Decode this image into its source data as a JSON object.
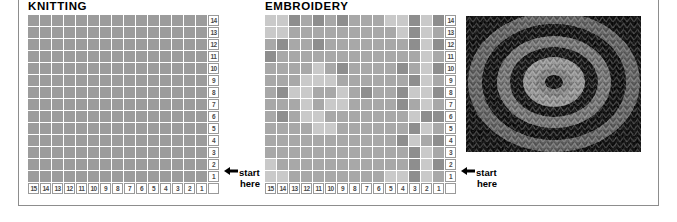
{
  "page": {
    "frame_color": "#8d8d8d",
    "background": "#ffffff"
  },
  "panels": [
    {
      "id": "knitting",
      "title": "KNITTING",
      "columns": 15,
      "rows": 14,
      "row_labels": [
        "14",
        "13",
        "12",
        "11",
        "10",
        "9",
        "8",
        "7",
        "6",
        "5",
        "4",
        "3",
        "2",
        "1"
      ],
      "column_labels": [
        "15",
        "14",
        "13",
        "12",
        "11",
        "10",
        "9",
        "8",
        "7",
        "6",
        "5",
        "4",
        "3",
        "2",
        "1"
      ],
      "start_note": {
        "line1": "start",
        "line2": "here",
        "arrow": "←"
      }
    },
    {
      "id": "embroidery",
      "title": "EMBROIDERY",
      "columns": 15,
      "rows": 14,
      "row_labels": [
        "14",
        "13",
        "12",
        "11",
        "10",
        "9",
        "8",
        "7",
        "6",
        "5",
        "4",
        "3",
        "2",
        "1"
      ],
      "column_labels": [
        "15",
        "14",
        "13",
        "12",
        "11",
        "10",
        "9",
        "8",
        "7",
        "6",
        "5",
        "4",
        "3",
        "2",
        "1"
      ],
      "start_note": {
        "line1": "start",
        "line2": "here",
        "arrow": "←"
      }
    }
  ],
  "chart_data": [
    {
      "type": "heatmap",
      "title": "KNITTING",
      "xlabel": "",
      "ylabel": "",
      "legend": "none",
      "grid": true,
      "x": [
        "15",
        "14",
        "13",
        "12",
        "11",
        "10",
        "9",
        "8",
        "7",
        "6",
        "5",
        "4",
        "3",
        "2",
        "1"
      ],
      "y": [
        "14",
        "13",
        "12",
        "11",
        "10",
        "9",
        "8",
        "7",
        "6",
        "5",
        "4",
        "3",
        "2",
        "1"
      ],
      "palette": {
        "gray": "#9c9c9c"
      },
      "values": [
        [
          "gray",
          "gray",
          "gray",
          "gray",
          "gray",
          "gray",
          "gray",
          "gray",
          "gray",
          "gray",
          "gray",
          "gray",
          "gray",
          "gray",
          "gray"
        ],
        [
          "gray",
          "gray",
          "gray",
          "gray",
          "gray",
          "gray",
          "gray",
          "gray",
          "gray",
          "gray",
          "gray",
          "gray",
          "gray",
          "gray",
          "gray"
        ],
        [
          "gray",
          "gray",
          "gray",
          "gray",
          "gray",
          "gray",
          "gray",
          "gray",
          "gray",
          "gray",
          "gray",
          "gray",
          "gray",
          "gray",
          "gray"
        ],
        [
          "gray",
          "gray",
          "gray",
          "gray",
          "gray",
          "gray",
          "gray",
          "gray",
          "gray",
          "gray",
          "gray",
          "gray",
          "gray",
          "gray",
          "gray"
        ],
        [
          "gray",
          "gray",
          "gray",
          "gray",
          "gray",
          "gray",
          "gray",
          "gray",
          "gray",
          "gray",
          "gray",
          "gray",
          "gray",
          "gray",
          "gray"
        ],
        [
          "gray",
          "gray",
          "gray",
          "gray",
          "gray",
          "gray",
          "gray",
          "gray",
          "gray",
          "gray",
          "gray",
          "gray",
          "gray",
          "gray",
          "gray"
        ],
        [
          "gray",
          "gray",
          "gray",
          "gray",
          "gray",
          "gray",
          "gray",
          "gray",
          "gray",
          "gray",
          "gray",
          "gray",
          "gray",
          "gray",
          "gray"
        ],
        [
          "gray",
          "gray",
          "gray",
          "gray",
          "gray",
          "gray",
          "gray",
          "gray",
          "gray",
          "gray",
          "gray",
          "gray",
          "gray",
          "gray",
          "gray"
        ],
        [
          "gray",
          "gray",
          "gray",
          "gray",
          "gray",
          "gray",
          "gray",
          "gray",
          "gray",
          "gray",
          "gray",
          "gray",
          "gray",
          "gray",
          "gray"
        ],
        [
          "gray",
          "gray",
          "gray",
          "gray",
          "gray",
          "gray",
          "gray",
          "gray",
          "gray",
          "gray",
          "gray",
          "gray",
          "gray",
          "gray",
          "gray"
        ],
        [
          "gray",
          "gray",
          "gray",
          "gray",
          "gray",
          "gray",
          "gray",
          "gray",
          "gray",
          "gray",
          "gray",
          "gray",
          "gray",
          "gray",
          "gray"
        ],
        [
          "gray",
          "gray",
          "gray",
          "gray",
          "gray",
          "gray",
          "gray",
          "gray",
          "gray",
          "gray",
          "gray",
          "gray",
          "gray",
          "gray",
          "gray"
        ],
        [
          "gray",
          "gray",
          "gray",
          "gray",
          "gray",
          "gray",
          "gray",
          "gray",
          "gray",
          "gray",
          "gray",
          "gray",
          "gray",
          "gray",
          "gray"
        ],
        [
          "gray",
          "gray",
          "gray",
          "gray",
          "gray",
          "gray",
          "gray",
          "gray",
          "gray",
          "gray",
          "gray",
          "gray",
          "gray",
          "gray",
          "gray"
        ]
      ]
    },
    {
      "type": "heatmap",
      "title": "EMBROIDERY",
      "xlabel": "",
      "ylabel": "",
      "legend": "none",
      "grid": true,
      "x": [
        "15",
        "14",
        "13",
        "12",
        "11",
        "10",
        "9",
        "8",
        "7",
        "6",
        "5",
        "4",
        "3",
        "2",
        "1"
      ],
      "y": [
        "14",
        "13",
        "12",
        "11",
        "10",
        "9",
        "8",
        "7",
        "6",
        "5",
        "4",
        "3",
        "2",
        "1"
      ],
      "palette": {
        "light": "#c9c9c9",
        "mid": "#a8a8a8",
        "dark": "#8e8e8e"
      },
      "values": [
        [
          "light",
          "light",
          "dark",
          "mid",
          "dark",
          "mid",
          "dark",
          "mid",
          "mid",
          "mid",
          "light",
          "light",
          "dark",
          "light",
          "dark"
        ],
        [
          "light",
          "light",
          "mid",
          "mid",
          "mid",
          "mid",
          "mid",
          "mid",
          "mid",
          "mid",
          "mid",
          "light",
          "dark",
          "light",
          "mid"
        ],
        [
          "mid",
          "dark",
          "mid",
          "mid",
          "dark",
          "mid",
          "mid",
          "mid",
          "mid",
          "mid",
          "mid",
          "mid",
          "dark",
          "light",
          "dark"
        ],
        [
          "dark",
          "mid",
          "mid",
          "mid",
          "mid",
          "mid",
          "mid",
          "mid",
          "mid",
          "mid",
          "mid",
          "mid",
          "mid",
          "light",
          "mid"
        ],
        [
          "mid",
          "mid",
          "mid",
          "mid",
          "light",
          "mid",
          "dark",
          "mid",
          "mid",
          "mid",
          "mid",
          "dark",
          "mid",
          "light",
          "dark"
        ],
        [
          "mid",
          "mid",
          "mid",
          "light",
          "light",
          "light",
          "mid",
          "mid",
          "mid",
          "mid",
          "mid",
          "mid",
          "dark",
          "light",
          "mid"
        ],
        [
          "mid",
          "dark",
          "light",
          "light",
          "mid",
          "mid",
          "light",
          "mid",
          "dark",
          "mid",
          "mid",
          "dark",
          "light",
          "light",
          "dark"
        ],
        [
          "mid",
          "mid",
          "mid",
          "light",
          "mid",
          "light",
          "light",
          "mid",
          "mid",
          "mid",
          "mid",
          "dark",
          "mid",
          "light",
          "mid"
        ],
        [
          "mid",
          "dark",
          "mid",
          "light",
          "light",
          "mid",
          "mid",
          "mid",
          "mid",
          "mid",
          "mid",
          "mid",
          "light",
          "dark",
          "dark"
        ],
        [
          "mid",
          "mid",
          "mid",
          "mid",
          "light",
          "light",
          "mid",
          "mid",
          "mid",
          "mid",
          "mid",
          "mid",
          "dark",
          "light",
          "mid"
        ],
        [
          "mid",
          "mid",
          "mid",
          "mid",
          "mid",
          "mid",
          "mid",
          "mid",
          "mid",
          "mid",
          "mid",
          "dark",
          "light",
          "mid",
          "dark"
        ],
        [
          "mid",
          "mid",
          "mid",
          "mid",
          "mid",
          "mid",
          "mid",
          "mid",
          "mid",
          "mid",
          "mid",
          "mid",
          "dark",
          "light",
          "mid"
        ],
        [
          "light",
          "mid",
          "mid",
          "mid",
          "mid",
          "mid",
          "mid",
          "mid",
          "mid",
          "mid",
          "mid",
          "mid",
          "dark",
          "light",
          "dark"
        ],
        [
          "light",
          "light",
          "mid",
          "mid",
          "mid",
          "mid",
          "mid",
          "mid",
          "mid",
          "mid",
          "light",
          "light",
          "dark",
          "light",
          "mid"
        ]
      ]
    }
  ],
  "photo": {
    "name": "knitted-swatch-photo",
    "description": "knitted fabric swatch with concentric ring motif",
    "ring_colors": [
      "#1c1c1c",
      "#8a8a8a",
      "#3a3a3a",
      "#b5b5b5",
      "#2a2a2a",
      "#707070"
    ]
  }
}
